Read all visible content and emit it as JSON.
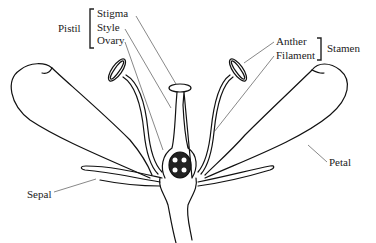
{
  "diagram": {
    "groups": {
      "pistil": {
        "label": "Pistil",
        "parts": [
          "Stigma",
          "Style",
          "Ovary"
        ]
      },
      "stamen": {
        "label": "Stamen",
        "parts": [
          "Anther",
          "Filament"
        ]
      }
    },
    "labels": {
      "pistil": "Pistil",
      "stigma": "Stigma",
      "style": "Style",
      "ovary": "Ovary",
      "anther": "Anther",
      "filament": "Filament",
      "stamen": "Stamen",
      "petal": "Petal",
      "sepal": "Sepal"
    },
    "colors": {
      "outline": "#111111",
      "leader_line": "#555555",
      "text": "#222222",
      "background": "#ffffff"
    }
  }
}
